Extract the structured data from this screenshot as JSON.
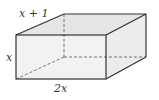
{
  "diagram": {
    "type": "rectangular-prism",
    "labels": {
      "depth": "x + 1",
      "height": "x",
      "width": "2x"
    },
    "colors": {
      "edge": "#333333",
      "hidden_edge": "#555555",
      "front_face": "#f2f2f2",
      "top_face": "#e6e6e6",
      "side_face": "#ececec",
      "background": "#ffffff"
    }
  }
}
